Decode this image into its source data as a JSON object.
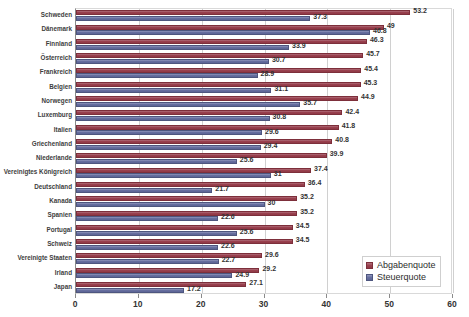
{
  "chart_data": {
    "type": "bar",
    "orientation": "horizontal",
    "title": "",
    "xlabel": "",
    "ylabel": "",
    "xlim": [
      0,
      60
    ],
    "xticks": [
      0,
      10,
      20,
      30,
      40,
      50,
      60
    ],
    "grid": true,
    "legend_position": "bottom-right",
    "categories": [
      "Schweden",
      "Dänemark",
      "Finnland",
      "Österreich",
      "Frankreich",
      "Belgien",
      "Norwegen",
      "Luxemburg",
      "Italien",
      "Griechenland",
      "Niederlande",
      "Vereinigtes Königreich",
      "Deutschland",
      "Kanada",
      "Spanien",
      "Portugal",
      "Schweiz",
      "Vereinigte Staaten",
      "Irland",
      "Japan"
    ],
    "series": [
      {
        "name": "Abgabenquote",
        "color": "#9a414f",
        "values": [
          53.2,
          49,
          46.3,
          45.7,
          45.4,
          45.3,
          44.9,
          42.4,
          41.8,
          40.8,
          39.9,
          37.4,
          36.4,
          35.2,
          35.2,
          34.5,
          34.5,
          29.6,
          29.2,
          27.1
        ],
        "labels": [
          "53.2",
          "49",
          "46.3",
          "45.7",
          "45.4",
          "45.3",
          "44.9",
          "42.4",
          "41.8",
          "40.8",
          "39.9",
          "37.4",
          "36.4",
          "35.2",
          "35.2",
          "34.5",
          "34.5",
          "29.6",
          "29.2",
          "27.1"
        ]
      },
      {
        "name": "Steuerquote",
        "color": "#676f9f",
        "values": [
          37.3,
          46.8,
          33.9,
          30.7,
          28.9,
          31.1,
          35.7,
          30.8,
          29.6,
          29.4,
          25.6,
          31,
          21.7,
          30,
          22.6,
          25.6,
          22.6,
          22.7,
          24.9,
          17.2
        ],
        "labels": [
          "37.3",
          "46.8",
          "33.9",
          "30.7",
          "28.9",
          "31.1",
          "35.7",
          "30.8",
          "29.6",
          "29.4",
          "25.6",
          "31",
          "21.7",
          "30",
          "22.6",
          "25.6",
          "22.6",
          "22.7",
          "24.9",
          "17.2"
        ]
      }
    ]
  },
  "legend": {
    "items": [
      {
        "label": "Abgabenquote",
        "swatch": "legend-swatch-abgabenquote"
      },
      {
        "label": "Steuerquote",
        "swatch": "legend-swatch-steuerquote"
      }
    ]
  }
}
